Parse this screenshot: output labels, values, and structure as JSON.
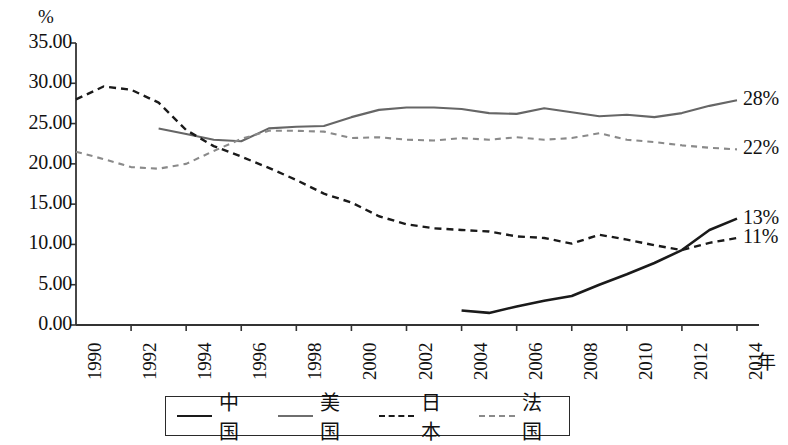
{
  "chart_data": {
    "type": "line",
    "title": "",
    "subtitle": "",
    "xlabel": "年",
    "ylabel": "%",
    "ylim": [
      0,
      35
    ],
    "xlim": [
      1990,
      2014
    ],
    "grid": false,
    "legend_position": "bottom",
    "y_ticks": [
      "0.00",
      "5.00",
      "10.00",
      "15.00",
      "20.00",
      "25.00",
      "30.00",
      "35.00"
    ],
    "y_tick_values": [
      0,
      5,
      10,
      15,
      20,
      25,
      30,
      35
    ],
    "x_ticks": [
      "1990",
      "1992",
      "1994",
      "1996",
      "1998",
      "2000",
      "2002",
      "2004",
      "2006",
      "2008",
      "2010",
      "2012",
      "2014"
    ],
    "x_tick_values": [
      1990,
      1992,
      1994,
      1996,
      1998,
      2000,
      2002,
      2004,
      2006,
      2008,
      2010,
      2012,
      2014
    ],
    "series": [
      {
        "name": "中国",
        "style": "solid",
        "color": "#1a1a1a",
        "width": 2.6,
        "end_label": "13%",
        "x": [
          2004,
          2005,
          2006,
          2007,
          2008,
          2009,
          2010,
          2011,
          2012,
          2013,
          2014
        ],
        "values": [
          1.8,
          1.5,
          2.3,
          3.0,
          3.6,
          5.0,
          6.3,
          7.7,
          9.3,
          11.8,
          13.2
        ]
      },
      {
        "name": "美国",
        "style": "solid",
        "color": "#666666",
        "width": 2.1,
        "end_label": "28%",
        "x": [
          1993,
          1994,
          1995,
          1996,
          1997,
          1998,
          1999,
          2000,
          2001,
          2002,
          2003,
          2004,
          2005,
          2006,
          2007,
          2008,
          2009,
          2010,
          2011,
          2012,
          2013,
          2014
        ],
        "values": [
          24.4,
          23.7,
          23.0,
          22.8,
          24.4,
          24.6,
          24.7,
          25.8,
          26.7,
          27.0,
          27.0,
          26.8,
          26.3,
          26.2,
          26.9,
          26.4,
          25.9,
          26.1,
          25.8,
          26.3,
          27.2,
          27.9
        ]
      },
      {
        "name": "日本",
        "style": "dashed",
        "color": "#1a1a1a",
        "width": 2.4,
        "end_label": "11%",
        "x": [
          1990,
          1991,
          1992,
          1993,
          1994,
          1995,
          1996,
          1997,
          1998,
          1999,
          2000,
          2001,
          2002,
          2003,
          2004,
          2005,
          2006,
          2007,
          2008,
          2009,
          2010,
          2011,
          2012,
          2013,
          2014
        ],
        "values": [
          28.0,
          29.6,
          29.2,
          27.6,
          24.2,
          22.2,
          20.9,
          19.5,
          18.0,
          16.3,
          15.2,
          13.5,
          12.5,
          12.0,
          11.8,
          11.6,
          11.0,
          10.8,
          10.1,
          11.2,
          10.6,
          9.9,
          9.3,
          10.2,
          10.8
        ]
      },
      {
        "name": "法国",
        "style": "dashed",
        "color": "#8a8a8a",
        "width": 2.1,
        "end_label": "22%",
        "x": [
          1990,
          1991,
          1992,
          1993,
          1994,
          1995,
          1996,
          1997,
          1998,
          1999,
          2000,
          2001,
          2002,
          2003,
          2004,
          2005,
          2006,
          2007,
          2008,
          2009,
          2010,
          2011,
          2012,
          2013,
          2014
        ],
        "values": [
          21.5,
          20.6,
          19.6,
          19.4,
          20.0,
          21.6,
          23.1,
          24.1,
          24.1,
          24.0,
          23.2,
          23.3,
          23.0,
          22.9,
          23.2,
          23.0,
          23.3,
          23.0,
          23.2,
          23.8,
          23.0,
          22.7,
          22.3,
          22.0,
          21.8
        ]
      }
    ]
  },
  "legend": {
    "items": [
      {
        "label": "中国",
        "style": "solid",
        "color": "#1a1a1a"
      },
      {
        "label": "美国",
        "style": "solid",
        "color": "#6e6e6e"
      },
      {
        "label": "日本",
        "style": "dashed",
        "color": "#1a1a1a"
      },
      {
        "label": "法国",
        "style": "dashed",
        "color": "#8a8a8a"
      }
    ]
  },
  "axes": {
    "y_unit": "%",
    "x_unit": "年",
    "axis_color": "#333333"
  }
}
